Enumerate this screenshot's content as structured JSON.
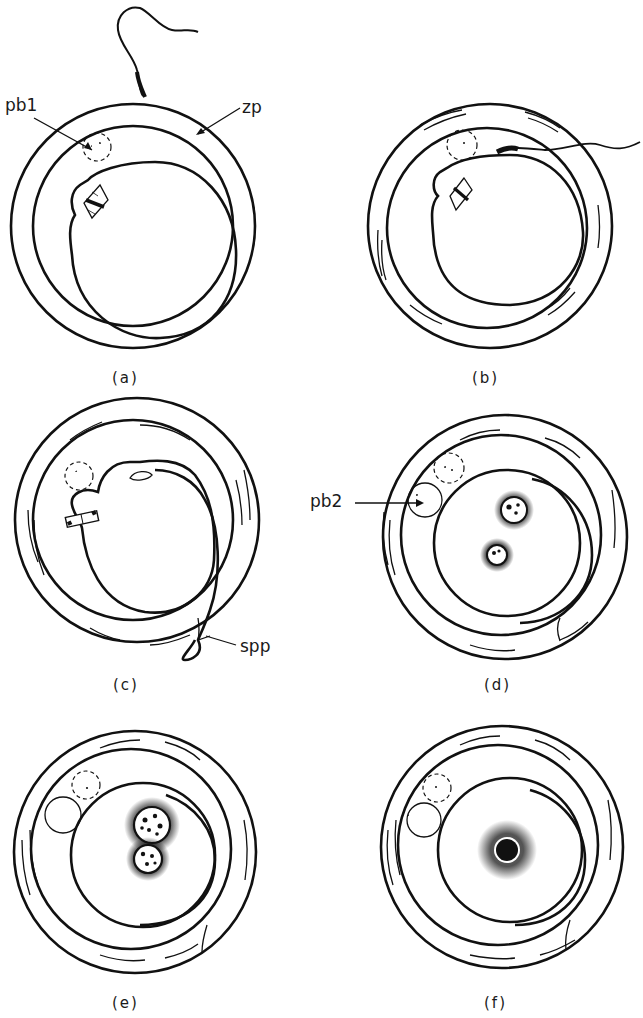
{
  "figure": {
    "panels": [
      {
        "id": "a",
        "caption": "(a)"
      },
      {
        "id": "b",
        "caption": "(b)"
      },
      {
        "id": "c",
        "caption": "(c)"
      },
      {
        "id": "d",
        "caption": "(d)"
      },
      {
        "id": "e",
        "caption": "(e)"
      },
      {
        "id": "f",
        "caption": "(f)"
      }
    ],
    "labels": {
      "pb1": "pb1",
      "zp": "zp",
      "spp": "spp",
      "pb2": "pb2"
    }
  }
}
